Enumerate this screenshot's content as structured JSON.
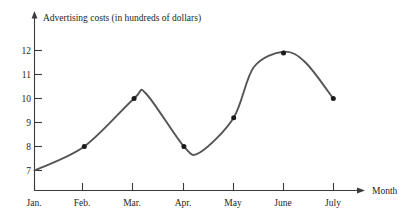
{
  "chart_data": {
    "type": "line",
    "title": "Advertising costs (in hundreds of dollars)",
    "xlabel": "Month",
    "ylabel": "",
    "categories": [
      "Jan.",
      "Feb.",
      "Mar.",
      "Apr.",
      "May",
      "June",
      "July"
    ],
    "values": [
      7,
      8,
      10,
      8,
      9.2,
      11.9,
      10
    ],
    "ylim": [
      6.2,
      12.4
    ],
    "yticks": [
      7,
      8,
      9,
      10,
      11,
      12
    ],
    "ytick_labels": [
      "7",
      "8",
      "9",
      "10",
      "11",
      "12"
    ],
    "xtick_labels": [
      "Jan.",
      "Feb.",
      "Mar.",
      "Apr.",
      "May",
      "June",
      "July"
    ],
    "grid": false,
    "legend": null,
    "markers": true,
    "smoothed": true,
    "annotations": [],
    "curve_notes": {
      "local_max_after_mar": 10.2,
      "local_min_between_apr_and_may": 7.75,
      "peak_near_june": 11.95
    }
  },
  "labels": {
    "title": "Advertising costs (in hundreds of dollars)",
    "x_axis_name": "Month",
    "y_tick_12": "12",
    "y_tick_11": "11",
    "y_tick_10": "10",
    "y_tick_9": "9",
    "y_tick_8": "8",
    "y_tick_7": "7",
    "x_tick_jan": "Jan.",
    "x_tick_feb": "Feb.",
    "x_tick_mar": "Mar.",
    "x_tick_apr": "Apr.",
    "x_tick_may": "May",
    "x_tick_june": "June",
    "x_tick_july": "July"
  },
  "colors": {
    "curve": "#555355",
    "axis": "#3b3a3a",
    "point": "#1a1a1a",
    "text": "#231f20",
    "background": "#ffffff"
  }
}
